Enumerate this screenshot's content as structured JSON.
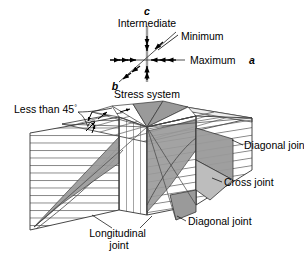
{
  "figure": {
    "background_color": "#ffffff",
    "line_color": "#000000",
    "gray_fill": "#9a9a9a",
    "light_fill": "#d8d8d8",
    "axis_gray": "#9e9e9e"
  },
  "stress_diagram": {
    "caption": "Stress system",
    "axis_c_label": "c",
    "axis_b_label": "b",
    "intermediate_label": "Intermediate",
    "minimum_label": "Minimum",
    "maximum_label": "Maximum",
    "maximum_axis_label": "a"
  },
  "block_diagram": {
    "less_than_label": "Less than 45",
    "degree_symbol": "°",
    "diagonal_joint_upper": "Diagonal joint",
    "cross_joint": "Cross joint",
    "diagonal_joint_lower": "Diagonal joint",
    "longitudinal_joint_line1": "Longitudinal",
    "longitudinal_joint_line2": "joint"
  }
}
